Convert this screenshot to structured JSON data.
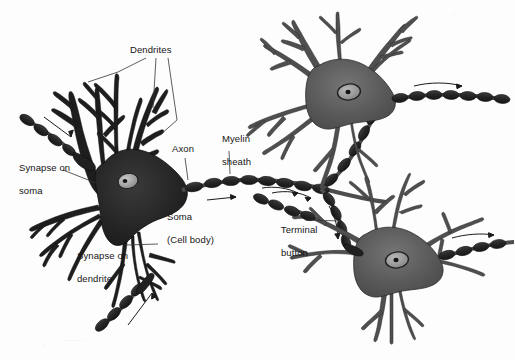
{
  "figure": {
    "type": "biological-illustration",
    "background_color": "#fdfdfd",
    "ink_color": "#151515"
  },
  "palette": {
    "soma_dark": "#242424",
    "soma_mid": "#5c5c5c",
    "soma_light": "#8a8a8a",
    "nucleus_fill": "#a8a8a8",
    "nucleus_dark": "#1d1d1d",
    "myelin": "#2b2b2b",
    "outline": "#141414",
    "leader": "#333333"
  },
  "labels": [
    {
      "id": "dendrites",
      "text": "Dendrites",
      "x": 130,
      "y": 44,
      "lines": [
        "Dendrites"
      ]
    },
    {
      "id": "synapse-on-soma",
      "text": "Synapse on soma",
      "x": 8,
      "y": 150,
      "lines": [
        "Synapse on",
        "soma"
      ]
    },
    {
      "id": "axon",
      "text": "Axon",
      "x": 172,
      "y": 143,
      "lines": [
        "Axon"
      ]
    },
    {
      "id": "myelin-sheath",
      "text": "Myelin sheath",
      "x": 211,
      "y": 121,
      "lines": [
        "Myelin",
        "sheath"
      ]
    },
    {
      "id": "soma-cell-body",
      "text": "Soma (Cell body)",
      "x": 156,
      "y": 199,
      "lines": [
        "Soma",
        "(Cell body)"
      ]
    },
    {
      "id": "synapse-on-dendrite",
      "text": "Synapse on dendrite",
      "x": 66,
      "y": 238,
      "lines": [
        "Synapse on",
        "dendrite"
      ]
    },
    {
      "id": "terminal-button",
      "text": "Terminal button",
      "x": 270,
      "y": 212,
      "lines": [
        "Terminal",
        "button"
      ]
    }
  ],
  "neurons": [
    {
      "id": "neuron-left",
      "role": "labeled primary neuron",
      "shade": "dark",
      "cx": 125,
      "cy": 190
    },
    {
      "id": "neuron-top-right",
      "role": "postsynaptic neuron",
      "shade": "mid",
      "cx": 345,
      "cy": 90
    },
    {
      "id": "neuron-bottom-right",
      "role": "postsynaptic neuron",
      "shade": "mid",
      "cx": 390,
      "cy": 250
    }
  ],
  "annotations": {
    "flow_arrows": 7,
    "myelin_segment_count": 34,
    "description": "Three interconnected multipolar neurons; myelinated axons carry signals from the left neuron to two neurons on the right; arrows indicate direction of impulse conduction."
  }
}
